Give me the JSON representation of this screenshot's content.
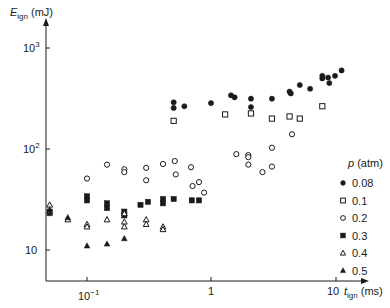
{
  "chart_data": {
    "type": "scatter",
    "title": "",
    "xlabel": "t_ign (ms)",
    "ylabel": "E_ign (mJ)",
    "xscale": "log",
    "yscale": "log",
    "xlim": [
      0.045,
      15
    ],
    "ylim": [
      5.2,
      1500
    ],
    "x_ticks": [
      {
        "value": 0.1,
        "label": "10^-1"
      },
      {
        "value": 1,
        "label": "1"
      },
      {
        "value": 10,
        "label": "10"
      }
    ],
    "y_ticks": [
      {
        "value": 10,
        "label": "10"
      },
      {
        "value": 100,
        "label": "10^2"
      },
      {
        "value": 1000,
        "label": "10^3"
      }
    ],
    "grid": false,
    "legend": {
      "title": "p (atm)",
      "position": "right"
    },
    "series": [
      {
        "name": "0.08",
        "marker": "filled-circle",
        "points": [
          [
            0.5,
            290
          ],
          [
            0.5,
            255
          ],
          [
            0.61,
            265
          ],
          [
            1.0,
            285
          ],
          [
            1.45,
            340
          ],
          [
            1.55,
            325
          ],
          [
            2.1,
            315
          ],
          [
            2.1,
            260
          ],
          [
            3.1,
            315
          ],
          [
            4.3,
            370
          ],
          [
            4.4,
            355
          ],
          [
            5.2,
            430
          ],
          [
            6.3,
            395
          ],
          [
            7.9,
            530
          ],
          [
            7.9,
            500
          ],
          [
            8.8,
            510
          ],
          [
            9.0,
            450
          ],
          [
            10.0,
            530
          ],
          [
            11.3,
            600
          ]
        ]
      },
      {
        "name": "0.1",
        "marker": "open-square",
        "points": [
          [
            0.5,
            190
          ],
          [
            1.3,
            220
          ],
          [
            2.1,
            225
          ],
          [
            3.1,
            200
          ],
          [
            4.3,
            210
          ],
          [
            5.2,
            200
          ],
          [
            7.9,
            265
          ]
        ]
      },
      {
        "name": "0.2",
        "marker": "open-circle",
        "points": [
          [
            0.1,
            51
          ],
          [
            0.145,
            70
          ],
          [
            0.2,
            63
          ],
          [
            0.2,
            59
          ],
          [
            0.3,
            65
          ],
          [
            0.3,
            49
          ],
          [
            0.41,
            71
          ],
          [
            0.51,
            76
          ],
          [
            0.52,
            56
          ],
          [
            0.69,
            66
          ],
          [
            0.71,
            43
          ],
          [
            0.8,
            47
          ],
          [
            0.88,
            37
          ],
          [
            1.6,
            89
          ],
          [
            2.0,
            87
          ],
          [
            2.0,
            83
          ],
          [
            2.0,
            70
          ],
          [
            2.6,
            59
          ],
          [
            3.1,
            67
          ],
          [
            3.1,
            103
          ],
          [
            4.5,
            140
          ]
        ]
      },
      {
        "name": "0.3",
        "marker": "filled-square",
        "points": [
          [
            0.05,
            24
          ],
          [
            0.1,
            34
          ],
          [
            0.1,
            31
          ],
          [
            0.145,
            29
          ],
          [
            0.145,
            26
          ],
          [
            0.2,
            24
          ],
          [
            0.2,
            22
          ],
          [
            0.27,
            28
          ],
          [
            0.31,
            30
          ],
          [
            0.41,
            32
          ],
          [
            0.41,
            29
          ],
          [
            0.5,
            32
          ],
          [
            0.7,
            31
          ],
          [
            0.8,
            31
          ]
        ]
      },
      {
        "name": "0.4",
        "marker": "open-triangle",
        "points": [
          [
            0.05,
            28
          ],
          [
            0.05,
            24
          ],
          [
            0.07,
            20
          ],
          [
            0.1,
            18
          ],
          [
            0.1,
            17
          ],
          [
            0.145,
            20
          ],
          [
            0.2,
            23
          ],
          [
            0.2,
            19
          ],
          [
            0.2,
            17
          ],
          [
            0.3,
            20
          ],
          [
            0.3,
            18
          ],
          [
            0.41,
            17
          ],
          [
            0.41,
            16
          ]
        ]
      },
      {
        "name": "0.5",
        "marker": "filled-triangle",
        "points": [
          [
            0.05,
            25
          ],
          [
            0.05,
            23
          ],
          [
            0.07,
            21
          ],
          [
            0.1,
            11
          ],
          [
            0.145,
            11.5
          ],
          [
            0.2,
            13
          ]
        ]
      }
    ]
  },
  "axes": {
    "y_title_main": "E",
    "y_title_sub": "ign",
    "y_title_unit": "(mJ)",
    "x_title_main": "t",
    "x_title_sub": "ign",
    "x_title_unit": "(ms)",
    "y_tick_10": "10",
    "y_tick_100_base": "10",
    "y_tick_100_exp": "2",
    "y_tick_1000_base": "10",
    "y_tick_1000_exp": "3",
    "x_tick_01_base": "10",
    "x_tick_01_exp": "−1",
    "x_tick_1": "1",
    "x_tick_10": "10"
  },
  "legend": {
    "title_var": "p",
    "title_unit": "(atm)",
    "items": [
      "0.08",
      "0.1",
      "0.2",
      "0.3",
      "0.4",
      "0.5"
    ]
  }
}
